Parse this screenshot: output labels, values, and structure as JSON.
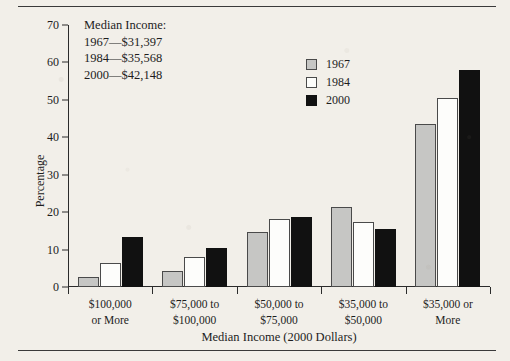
{
  "chart_data": {
    "type": "bar",
    "title": "",
    "xlabel": "Median Income (2000 Dollars)",
    "ylabel": "Percentage",
    "ylim": [
      0,
      70
    ],
    "ytick_values": [
      70,
      60,
      50,
      40,
      30,
      20,
      10,
      0
    ],
    "grid": false,
    "legend_position": "upper-center",
    "categories": [
      "$100,000 or More",
      "$75,000 to $100,000",
      "$50,000 to $75,000",
      "$35,000 to $50,000",
      "$35,000 or More"
    ],
    "category_lines": [
      [
        "$100,000",
        "or More"
      ],
      [
        "$75,000 to",
        "$100,000"
      ],
      [
        "$50,000 to",
        "$75,000"
      ],
      [
        "$35,000 to",
        "$50,000"
      ],
      [
        "$35,000 or",
        "More"
      ]
    ],
    "series": [
      {
        "name": "1967",
        "color": "#c6c6c4",
        "values": [
          2.8,
          4.3,
          14.6,
          21.5,
          43.5
        ]
      },
      {
        "name": "1984",
        "color": "#fdfdfb",
        "values": [
          6.4,
          8.0,
          18.1,
          17.5,
          50.5
        ]
      },
      {
        "name": "2000",
        "color": "#111111",
        "values": [
          13.4,
          10.5,
          18.8,
          15.4,
          58.0
        ]
      }
    ],
    "annotations": {
      "heading": "Median Income:",
      "lines": [
        "1967—$31,397",
        "1984—$35,568",
        "2000—$42,148"
      ]
    }
  }
}
